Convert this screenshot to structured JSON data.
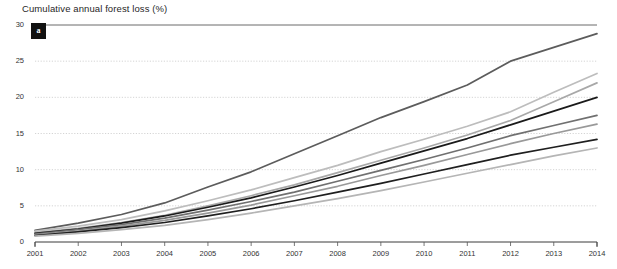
{
  "chart_data": {
    "type": "line",
    "title": "Cumulative annual forest loss (%)",
    "xlabel": "",
    "ylabel": "",
    "grid": true,
    "legend_position": "none",
    "x": [
      2001,
      2002,
      2003,
      2004,
      2005,
      2006,
      2007,
      2008,
      2009,
      2010,
      2011,
      2012,
      2013,
      2014
    ],
    "xtick_labels": [
      "2001",
      "2002",
      "2003",
      "2004",
      "2005",
      "2006",
      "2007",
      "2008",
      "2009",
      "2010",
      "2011",
      "2012",
      "2013",
      "2014"
    ],
    "ytick_labels": [
      "0",
      "5",
      "10",
      "15",
      "20",
      "25",
      "30"
    ],
    "yticks": [
      0,
      5,
      10,
      15,
      20,
      25,
      30
    ],
    "ylim": [
      0,
      30
    ],
    "xlim": [
      2001,
      2014
    ],
    "annotation_badge": "a",
    "series": [
      {
        "name": "series-1",
        "color": "#5c5c5c",
        "values": [
          1.6,
          2.6,
          3.8,
          5.4,
          7.6,
          9.7,
          12.2,
          14.7,
          17.2,
          19.4,
          21.7,
          25.0,
          26.9,
          28.8
        ]
      },
      {
        "name": "series-2",
        "color": "#bdbdbd",
        "values": [
          1.5,
          2.2,
          3.1,
          4.3,
          5.7,
          7.2,
          8.9,
          10.6,
          12.5,
          14.2,
          16.0,
          18.0,
          20.7,
          23.3
        ]
      },
      {
        "name": "series-3",
        "color": "#a8a8a8",
        "values": [
          1.3,
          1.9,
          2.7,
          3.7,
          5.0,
          6.4,
          7.9,
          9.6,
          11.3,
          13.0,
          14.8,
          16.8,
          19.4,
          22.0
        ]
      },
      {
        "name": "series-4",
        "color": "#1a1a1a",
        "values": [
          1.2,
          1.8,
          2.6,
          3.6,
          4.8,
          6.1,
          7.6,
          9.2,
          10.9,
          12.6,
          14.3,
          16.2,
          18.1,
          20.0
        ]
      },
      {
        "name": "series-5",
        "color": "#707070",
        "values": [
          1.1,
          1.7,
          2.4,
          3.3,
          4.4,
          5.6,
          6.9,
          8.4,
          9.9,
          11.4,
          13.0,
          14.7,
          16.1,
          17.5
        ]
      },
      {
        "name": "series-6",
        "color": "#999999",
        "values": [
          1.0,
          1.5,
          2.2,
          3.0,
          4.0,
          5.1,
          6.4,
          7.7,
          9.2,
          10.6,
          12.1,
          13.6,
          15.0,
          16.3
        ]
      },
      {
        "name": "series-7",
        "color": "#1f1f1f",
        "values": [
          0.9,
          1.4,
          2.0,
          2.7,
          3.6,
          4.6,
          5.7,
          6.9,
          8.1,
          9.4,
          10.7,
          12.0,
          13.1,
          14.2
        ]
      },
      {
        "name": "series-8",
        "color": "#b5b5b5",
        "values": [
          0.8,
          1.2,
          1.7,
          2.3,
          3.1,
          4.0,
          5.0,
          6.0,
          7.1,
          8.3,
          9.5,
          10.7,
          11.9,
          13.0
        ]
      }
    ]
  }
}
